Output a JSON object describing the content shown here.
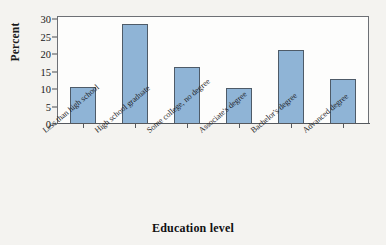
{
  "chart_data": {
    "type": "bar",
    "title": "",
    "xlabel": "Education level",
    "ylabel": "Percent",
    "categories": [
      "Less than high school",
      "High school graduate",
      "Some college, no degree",
      "Associate's degree",
      "Bachelor's degree",
      "Advanced degree"
    ],
    "values": [
      10.6,
      28.7,
      16.3,
      10.4,
      21.2,
      12.8
    ],
    "ylim": [
      0,
      31
    ],
    "yticks": [
      0,
      5,
      10,
      15,
      20,
      25,
      30
    ],
    "ytick_labels": [
      "0",
      "5",
      "10",
      "15",
      "20",
      "25",
      "30"
    ],
    "grid": false,
    "legend": null,
    "bar_color": "#8fb4d6",
    "bar_edge_color": "#4e5b68",
    "plot_background": "#fdfdfc",
    "figure_background": "#f4f3f0"
  }
}
